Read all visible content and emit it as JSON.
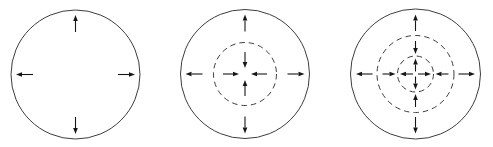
{
  "diagram": {
    "canvas": {
      "width": 493,
      "height": 147,
      "background": "#ffffff"
    },
    "circle_stroke": {
      "color": "#3d3d3d",
      "width": 1
    },
    "dash_pattern": "5.5 4",
    "arrow_style": {
      "color": "#161616",
      "shaft_width": 1.1,
      "head_length": 6,
      "head_width": 4.6
    },
    "arrow_directions": [
      "up",
      "right",
      "down",
      "left"
    ],
    "panels": [
      {
        "id": "circle-panel-left",
        "center": {
          "x": 75.5,
          "y": 74.5
        },
        "circles": [
          {
            "name": "outer-solid-circle",
            "r": 64.5,
            "line": "solid"
          }
        ],
        "arrow_rings": [
          {
            "name": "outward-arrows-at-rim",
            "from_r": 42.5,
            "to_r": 59.5
          }
        ]
      },
      {
        "id": "circle-panel-middle",
        "center": {
          "x": 245,
          "y": 74
        },
        "circles": [
          {
            "name": "outer-solid-circle",
            "r": 64.5,
            "line": "solid"
          },
          {
            "name": "inner-dashed-circle",
            "r": 31.5,
            "line": "dashed"
          }
        ],
        "arrow_rings": [
          {
            "name": "outward-arrows-at-rim",
            "from_r": 42.5,
            "to_r": 59.5
          },
          {
            "name": "inward-arrows-at-core",
            "from_r": 22,
            "to_r": 6
          }
        ]
      },
      {
        "id": "circle-panel-right",
        "center": {
          "x": 415.5,
          "y": 74
        },
        "circles": [
          {
            "name": "outer-solid-circle",
            "r": 65,
            "line": "solid"
          },
          {
            "name": "middle-dashed-circle",
            "r": 38.5,
            "line": "dashed"
          },
          {
            "name": "inner-dashed-circle",
            "r": 18,
            "line": "dashed"
          }
        ],
        "arrow_rings": [
          {
            "name": "outward-arrows-at-rim",
            "from_r": 43,
            "to_r": 59.5
          },
          {
            "name": "inward-arrows-at-middle",
            "from_r": 33,
            "to_r": 20
          },
          {
            "name": "outward-arrows-at-core",
            "from_r": 2.5,
            "to_r": 15.5
          }
        ]
      }
    ]
  }
}
